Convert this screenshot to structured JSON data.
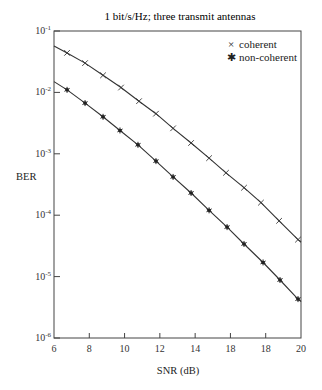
{
  "chart_data": {
    "type": "line",
    "title": "1 bit/s/Hz; three transmit antennas",
    "xlabel": "SNR (dB)",
    "ylabel": "BER",
    "xlim": [
      6,
      20
    ],
    "ylim": [
      1e-06,
      0.1
    ],
    "yscale": "log",
    "grid": false,
    "legend_position": "upper right",
    "x_ticks": [
      6,
      8,
      10,
      12,
      14,
      16,
      18,
      20
    ],
    "x_tick_labels": [
      "6",
      "8",
      "10",
      "12",
      "14",
      "18",
      "18",
      "20"
    ],
    "y_ticks": [
      0.1,
      0.01,
      0.001,
      0.0001,
      1e-05,
      1e-06
    ],
    "y_tick_labels": [
      {
        "base": "10",
        "exp": "-1"
      },
      {
        "base": "10",
        "exp": "-2"
      },
      {
        "base": "10",
        "exp": "-3"
      },
      {
        "base": "10",
        "exp": "-4"
      },
      {
        "base": "10",
        "exp": "-5"
      },
      {
        "base": "10",
        "exp": "-6"
      }
    ],
    "series": [
      {
        "name": "coherent",
        "marker": "×",
        "marker_type": "x",
        "line_start": {
          "x": 6,
          "y": 0.057
        },
        "line_end": {
          "x": 20,
          "y": 3.7e-05
        },
        "x": [
          6.74,
          7.76,
          8.78,
          9.8,
          10.82,
          11.78,
          12.75,
          13.77,
          14.79,
          15.75,
          16.77,
          17.73,
          18.76,
          19.83
        ],
        "values": [
          0.044,
          0.03,
          0.019,
          0.012,
          0.0072,
          0.0045,
          0.0026,
          0.0015,
          0.00085,
          0.00049,
          0.00028,
          0.00016,
          8.1e-05,
          4e-05
        ]
      },
      {
        "name": "non-coherent",
        "marker": "✱",
        "marker_type": "star",
        "line_start": {
          "x": 6,
          "y": 0.015
        },
        "line_end": {
          "x": 20,
          "y": 3.9e-06
        },
        "x": [
          6.74,
          7.76,
          8.78,
          9.74,
          10.76,
          11.78,
          12.75,
          13.77,
          14.79,
          15.81,
          16.77,
          17.85,
          18.81,
          19.83
        ],
        "values": [
          0.011,
          0.0067,
          0.004,
          0.0024,
          0.0014,
          0.00076,
          0.00042,
          0.00023,
          0.00012,
          6.4e-05,
          3.4e-05,
          1.7e-05,
          8.8e-06,
          4.3e-06
        ]
      }
    ]
  },
  "legend": {
    "items": [
      {
        "symbol": "×",
        "label": "coherent"
      },
      {
        "symbol": "✱",
        "label": "non-coherent"
      }
    ]
  },
  "colors": {
    "line": "#333333",
    "axis": "#444444",
    "background": "#ffffff"
  }
}
